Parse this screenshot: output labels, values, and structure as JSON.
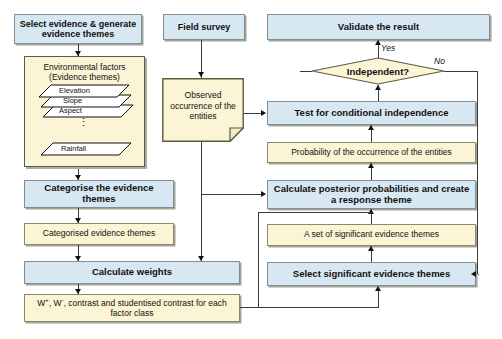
{
  "diagram": {
    "colors": {
      "process_fill": "#d7e8f2",
      "data_fill": "#fbf4d5",
      "border": "#8a8a78",
      "group_border": "#5c5a40",
      "connector": "#3a3a3a",
      "background": "#ffffff"
    },
    "nodes": {
      "select_evidence": {
        "label": "Select evidence & generate evidence themes",
        "shape": "process",
        "fill": "process_fill"
      },
      "field_survey": {
        "label": "Field survey",
        "shape": "process",
        "fill": "process_fill"
      },
      "validate_result": {
        "label": "Validate the result",
        "shape": "process",
        "fill": "process_fill"
      },
      "environmental_factors": {
        "title_line1": "Environmental factors",
        "title_line2": "(Evidence themes)",
        "shape": "group",
        "fill": "data_fill",
        "layers": [
          "Elevation",
          "Slope",
          "Aspect",
          "Rainfall"
        ],
        "ellipsis": "⋮"
      },
      "observed_occurrence": {
        "label": "Observed occurrence of the entities",
        "shape": "document",
        "fill": "data_fill"
      },
      "independent_decision": {
        "label": "Independent?",
        "shape": "diamond",
        "fill": "data_fill"
      },
      "test_conditional": {
        "label": "Test for conditional independence",
        "shape": "process",
        "fill": "process_fill"
      },
      "probability_occurrence": {
        "label": "Probability of the occurrence of the entities",
        "shape": "data",
        "fill": "data_fill"
      },
      "categorise_themes": {
        "label": "Categorise the evidence themes",
        "shape": "process",
        "fill": "process_fill"
      },
      "categorised_themes": {
        "label": "Categorised  evidence themes",
        "shape": "data",
        "fill": "data_fill"
      },
      "calculate_posterior": {
        "label": "Calculate posterior probabilities and create a response theme",
        "shape": "process",
        "fill": "process_fill"
      },
      "set_significant_themes": {
        "label": "A set of significant evidence themes",
        "shape": "data",
        "fill": "data_fill"
      },
      "calculate_weights": {
        "label": "Calculate weights",
        "shape": "process",
        "fill": "process_fill"
      },
      "select_significant_themes": {
        "label": "Select significant evidence themes",
        "shape": "process",
        "fill": "process_fill"
      },
      "weights_output": {
        "label_prefix": "W",
        "sup_plus": "+",
        "sup_minus": "-",
        "label": "W+, W-, contrast  and studentised contrast for each factor class",
        "label_part1": ", ",
        "label_part2": ", contrast  and studentised contrast for each factor class",
        "shape": "data",
        "fill": "data_fill"
      }
    },
    "edge_labels": {
      "yes": "Yes",
      "no": "No"
    }
  }
}
